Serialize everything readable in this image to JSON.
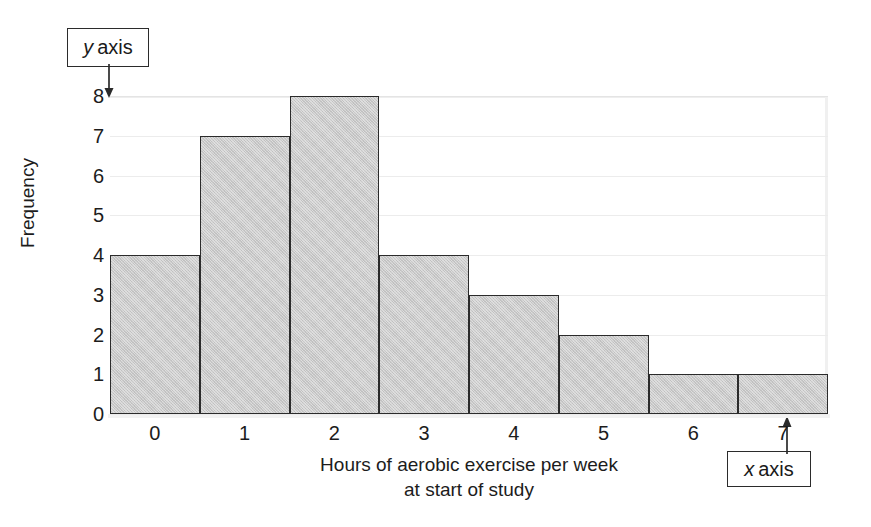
{
  "chart_data": {
    "type": "bar",
    "title": "",
    "subtitle": "",
    "xlabel_line1": "Hours of aerobic exercise per week",
    "xlabel_line2": "at start of study",
    "ylabel": "Frequency",
    "categories": [
      "0",
      "1",
      "2",
      "3",
      "4",
      "5",
      "6",
      "7"
    ],
    "values": [
      4,
      7,
      8,
      4,
      3,
      2,
      1,
      1
    ],
    "xtick_labels": [
      "0",
      "1",
      "2",
      "3",
      "4",
      "5",
      "6",
      "7"
    ],
    "ytick_labels": [
      "0",
      "1",
      "2",
      "3",
      "4",
      "5",
      "6",
      "7",
      "8"
    ],
    "ylim": [
      0,
      8
    ],
    "xlim": [
      -0.5,
      7.5
    ],
    "grid": "horizontal",
    "legend": "none",
    "bar_fill_color": "#c9c9c9",
    "bar_edge_color": "#2b2b2b",
    "gridline_color": "#ececec",
    "text_color": "#1c1c1c"
  },
  "annotations": {
    "y_axis_callout": {
      "italic_part": "y",
      "rest": "axis",
      "full": "y axis"
    },
    "x_axis_callout": {
      "italic_part": "x",
      "rest": "axis",
      "full": "x axis"
    }
  }
}
